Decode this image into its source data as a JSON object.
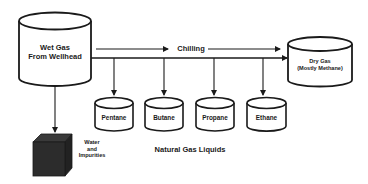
{
  "diagram": {
    "type": "process-flow",
    "colors": {
      "stroke": "#1a1a1a",
      "fill": "#ffffff",
      "cube": "#2a2a2a",
      "text": "#1a1a1a"
    },
    "source": {
      "label_line1": "Wet Gas",
      "label_line2": "From Wellhead"
    },
    "process": {
      "label": "Chilling"
    },
    "output": {
      "label_line1": "Dry Gas",
      "label_line2": "(Mostly Methane)"
    },
    "liquids": {
      "group_label": "Natural Gas Liquids",
      "items": [
        {
          "label": "Pentane"
        },
        {
          "label": "Butane"
        },
        {
          "label": "Propane"
        },
        {
          "label": "Ethane"
        }
      ]
    },
    "waste": {
      "label_line1": "Water",
      "label_line2": "and",
      "label_line3": "Impurities"
    }
  }
}
